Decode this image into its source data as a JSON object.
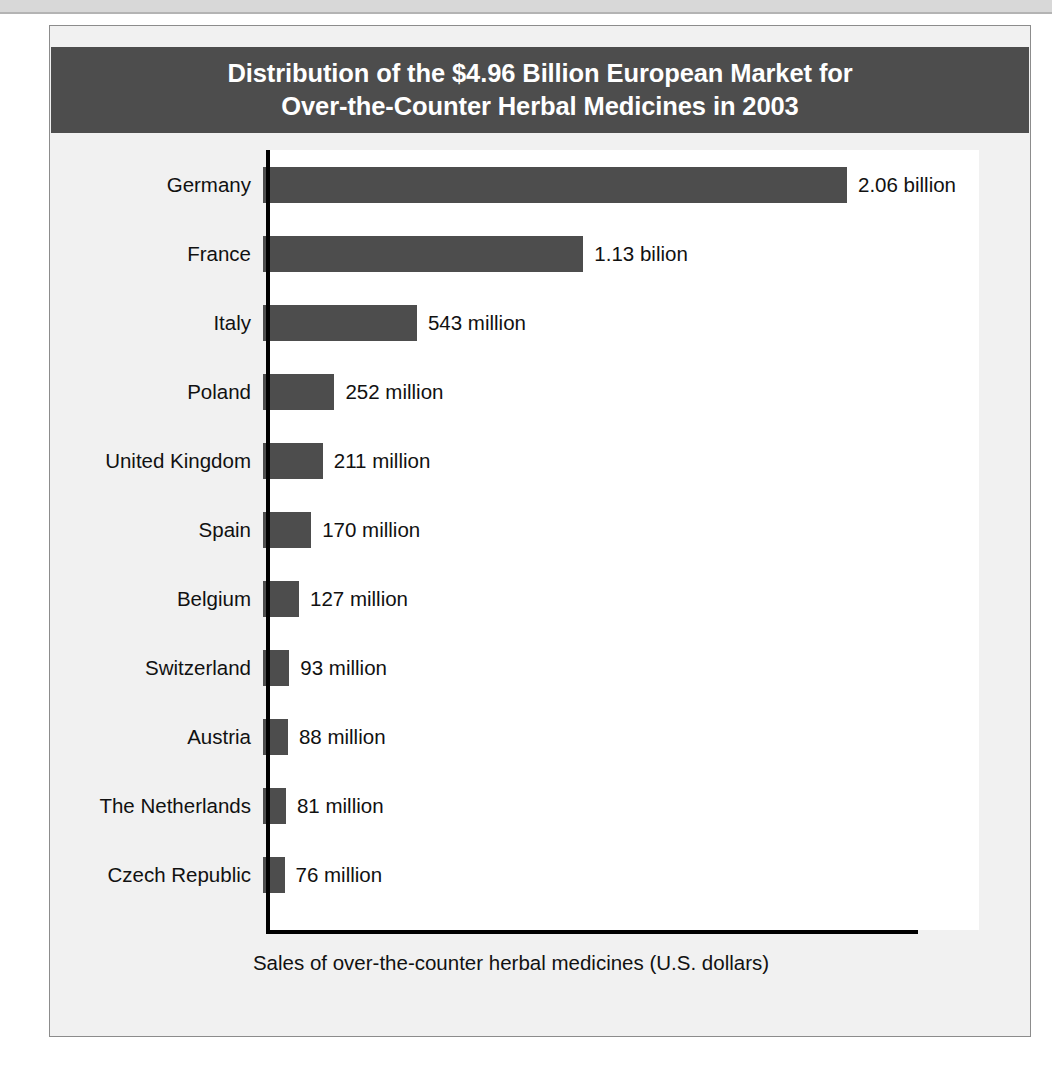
{
  "chart_data": {
    "type": "bar",
    "orientation": "horizontal",
    "title": "Distribution of the $4.96 Billion European Market for Over-the-Counter Herbal Medicines in 2003",
    "title_line1": "Distribution of the $4.96 Billion European Market for",
    "title_line2": "Over-the-Counter Herbal Medicines in 2003",
    "xlabel": "Sales of over-the-counter herbal medicines (U.S. dollars)",
    "ylabel": "",
    "grid": false,
    "legend": "none",
    "units": "U.S. dollars",
    "xlim": [
      0,
      2300
    ],
    "axis_tick_labels": [],
    "categories": [
      "Germany",
      "France",
      "Italy",
      "Poland",
      "United Kingdom",
      "Spain",
      "Belgium",
      "Switzerland",
      "Austria",
      "The Netherlands",
      "Czech Republic"
    ],
    "values": [
      2060,
      1130,
      543,
      252,
      211,
      170,
      127,
      93,
      88,
      81,
      76
    ],
    "value_labels": [
      "2.06 billion",
      "1.13 bilion",
      "543 million",
      "252 million",
      "211 million",
      "170 million",
      "127 million",
      "93 million",
      "88 million",
      "81 million",
      "76 million"
    ],
    "bars": [
      {
        "category": "Germany",
        "value": 2060,
        "label": "2.06 billion"
      },
      {
        "category": "France",
        "value": 1130,
        "label": "1.13 bilion"
      },
      {
        "category": "Italy",
        "value": 543,
        "label": "543 million"
      },
      {
        "category": "Poland",
        "value": 252,
        "label": "252 million"
      },
      {
        "category": "United Kingdom",
        "value": 211,
        "label": "211 million"
      },
      {
        "category": "Spain",
        "value": 170,
        "label": "170 million"
      },
      {
        "category": "Belgium",
        "value": 127,
        "label": "127 million"
      },
      {
        "category": "Switzerland",
        "value": 93,
        "label": "93 million"
      },
      {
        "category": "Austria",
        "value": 88,
        "label": "88 million"
      },
      {
        "category": "The Netherlands",
        "value": 81,
        "label": "81 million"
      },
      {
        "category": "Czech Republic",
        "value": 76,
        "label": "76 million"
      }
    ],
    "colors": {
      "bar": "#4d4d4d",
      "title_bar_background": "#4d4d4d",
      "title_text": "#ffffff",
      "plot_background": "#ffffff",
      "card_background": "#f1f1f1",
      "axis": "#000000",
      "text": "#111111"
    }
  }
}
